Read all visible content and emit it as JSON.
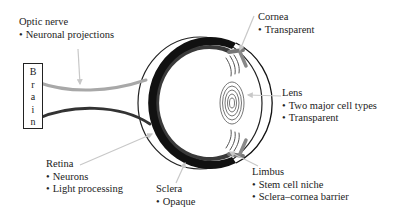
{
  "diagram": {
    "brain": {
      "letters": [
        "B",
        "r",
        "a",
        "i",
        "n"
      ]
    },
    "labels": {
      "optic_nerve": {
        "title": "Optic nerve",
        "bullets": [
          "Neuronal projections"
        ]
      },
      "cornea": {
        "title": "Cornea",
        "bullets": [
          "Transparent"
        ]
      },
      "lens": {
        "title": "Lens",
        "bullets": [
          "Two major cell types",
          "Transparent"
        ]
      },
      "retina": {
        "title": "Retina",
        "bullets": [
          "Neurons",
          "Light processing"
        ]
      },
      "sclera": {
        "title": "Sclera",
        "bullets": [
          "Opaque"
        ]
      },
      "limbus": {
        "title": "Limbus",
        "bullets": [
          "Stem cell niche",
          "Sclera–cornea barrier"
        ]
      }
    },
    "colors": {
      "sclera": "#111111",
      "retina_band": "#3a3a3a",
      "optic_nerve_light": "#a8a8a8",
      "optic_nerve_dark": "#333333",
      "pointer_arrow": "#c8c8c8",
      "outline": "#222222"
    }
  }
}
